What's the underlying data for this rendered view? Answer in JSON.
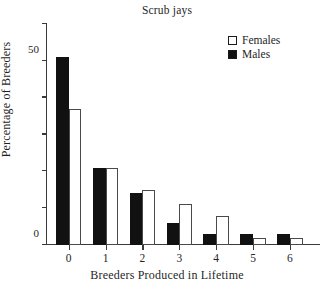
{
  "chart_data": {
    "type": "bar",
    "title": "Scrub jays",
    "xlabel": "Breeders Produced in Lifetime",
    "ylabel": "Percentage of Breeders",
    "categories": [
      "0",
      "1",
      "2",
      "3",
      "4",
      "5",
      "6"
    ],
    "series": [
      {
        "name": "Males",
        "color": "#111111",
        "values": [
          51,
          21,
          14,
          6,
          3,
          3,
          3
        ]
      },
      {
        "name": "Females",
        "color": "#ffffff",
        "values": [
          37,
          21,
          15,
          11,
          8,
          2,
          2
        ]
      }
    ],
    "ylim": [
      0,
      60
    ],
    "yticks": [
      0,
      10,
      20,
      30,
      40,
      50,
      60
    ],
    "ytick_labels": [
      "0",
      "",
      "",
      "",
      "",
      "50",
      ""
    ],
    "grid": false,
    "legend_position": "top-right",
    "legend": [
      {
        "label": "Females",
        "swatch": "open-square"
      },
      {
        "label": "Males",
        "swatch": "filled-square"
      }
    ]
  }
}
